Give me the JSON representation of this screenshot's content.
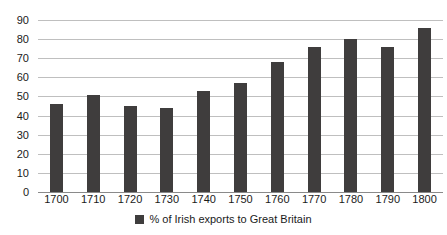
{
  "chart_data": {
    "type": "bar",
    "title": "",
    "subtitle": "",
    "xlabel": "",
    "ylabel": "",
    "categories": [
      "1700",
      "1710",
      "1720",
      "1730",
      "1740",
      "1750",
      "1760",
      "1770",
      "1780",
      "1790",
      "1800"
    ],
    "values": [
      46,
      51,
      45,
      44,
      53,
      57,
      68,
      76,
      80,
      76,
      86
    ],
    "series": [
      {
        "name": "% of Irish exports to Great Britain",
        "values": [
          46,
          51,
          45,
          44,
          53,
          57,
          68,
          76,
          80,
          76,
          86
        ],
        "color": "#3f3d3d"
      }
    ],
    "ylim": [
      0,
      90
    ],
    "yticks": [
      0,
      10,
      20,
      30,
      40,
      50,
      60,
      70,
      80,
      90
    ],
    "ytick_labels": [
      "0",
      "10",
      "20",
      "30",
      "40",
      "50",
      "60",
      "70",
      "80",
      "90"
    ],
    "grid": true,
    "grid_axis": "y",
    "legend": {
      "position": "bottom",
      "entries": [
        {
          "label": "% of Irish exports to Great Britain",
          "color": "#3f3d3d",
          "marker": "square"
        }
      ]
    },
    "colors": {
      "bar": "#3f3d3d",
      "gridline": "#bfbfbf",
      "baseline": "#8a8a8a",
      "text": "#1a1a1a",
      "background": "#ffffff"
    }
  }
}
